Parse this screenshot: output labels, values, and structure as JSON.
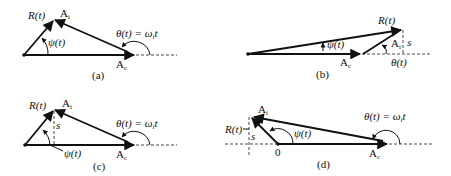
{
  "figure": {
    "panels": [
      {
        "id": "a",
        "caption": "(a)",
        "labels": {
          "resultant": "R(t)",
          "interference": "A",
          "interference_sub": "i",
          "carrier": "A",
          "carrier_sub": "c",
          "phase": "ψ(t)",
          "theta": "θ(t) = ω",
          "theta_sub": "i",
          "theta_tail": "t"
        }
      },
      {
        "id": "b",
        "caption": "(b)",
        "labels": {
          "resultant": "R(t)",
          "interference": "A",
          "interference_sub": "i",
          "carrier": "A",
          "carrier_sub": "c",
          "phase": "ψ(t)",
          "theta": "θ(t)",
          "s": "s"
        }
      },
      {
        "id": "c",
        "caption": "(c)",
        "labels": {
          "resultant": "R(t)",
          "interference": "A",
          "interference_sub": "i",
          "carrier": "A",
          "carrier_sub": "c",
          "phase": "ψ(t)",
          "theta": "θ(t) = ω",
          "theta_sub": "i",
          "theta_tail": "t",
          "s": "s"
        }
      },
      {
        "id": "d",
        "caption": "(d)",
        "labels": {
          "resultant": "R(t)",
          "interference": "A",
          "interference_sub": "i",
          "carrier": "A",
          "carrier_sub": "c",
          "phase": "ψ(t)",
          "theta": "θ(t) = ω",
          "theta_sub": "i",
          "theta_tail": "t",
          "s": "s",
          "origin": "0"
        }
      }
    ]
  }
}
